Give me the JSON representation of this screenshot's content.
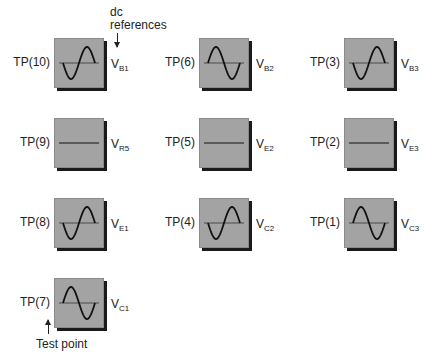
{
  "annotations": {
    "dc_references": "dc\nreferences",
    "test_point": "Test point"
  },
  "colors": {
    "scope_fill": "#a3a3a3",
    "scope_shadow": "#1a1a1a",
    "trace": "#111111"
  },
  "test_points": [
    {
      "id": "tp10",
      "label": "TP(10)",
      "ref": "V",
      "ref_sub": "B1",
      "waveform": "inverted-sine"
    },
    {
      "id": "tp6",
      "label": "TP(6)",
      "ref": "V",
      "ref_sub": "B2",
      "waveform": "sine"
    },
    {
      "id": "tp3",
      "label": "TP(3)",
      "ref": "V",
      "ref_sub": "B3",
      "waveform": "inverted-sine"
    },
    {
      "id": "tp9",
      "label": "TP(9)",
      "ref": "V",
      "ref_sub": "R5",
      "waveform": "flat"
    },
    {
      "id": "tp5",
      "label": "TP(5)",
      "ref": "V",
      "ref_sub": "E2",
      "waveform": "flat"
    },
    {
      "id": "tp2",
      "label": "TP(2)",
      "ref": "V",
      "ref_sub": "E3",
      "waveform": "flat"
    },
    {
      "id": "tp8",
      "label": "TP(8)",
      "ref": "V",
      "ref_sub": "E1",
      "waveform": "inverted-sine"
    },
    {
      "id": "tp4",
      "label": "TP(4)",
      "ref": "V",
      "ref_sub": "C2",
      "waveform": "inverted-sine"
    },
    {
      "id": "tp1",
      "label": "TP(1)",
      "ref": "V",
      "ref_sub": "C3",
      "waveform": "sine"
    },
    {
      "id": "tp7",
      "label": "TP(7)",
      "ref": "V",
      "ref_sub": "C1",
      "waveform": "sine"
    }
  ]
}
